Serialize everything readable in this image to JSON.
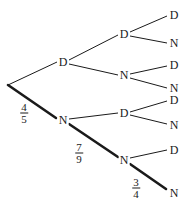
{
  "diagram": {
    "type": "probability-tree",
    "root": {
      "x": 8,
      "y": 85
    },
    "nodes": [
      {
        "id": "L1D",
        "label": "D",
        "x": 63,
        "y": 62
      },
      {
        "id": "L1N",
        "label": "N",
        "x": 63,
        "y": 120
      },
      {
        "id": "L2DD",
        "label": "D",
        "x": 124,
        "y": 34
      },
      {
        "id": "L2DN",
        "label": "N",
        "x": 124,
        "y": 75
      },
      {
        "id": "L2ND",
        "label": "D",
        "x": 124,
        "y": 113
      },
      {
        "id": "L2NN",
        "label": "N",
        "x": 124,
        "y": 160
      },
      {
        "id": "L3DDD",
        "label": "D",
        "x": 174,
        "y": 15
      },
      {
        "id": "L3DDN",
        "label": "N",
        "x": 174,
        "y": 43
      },
      {
        "id": "L3DND",
        "label": "D",
        "x": 174,
        "y": 65
      },
      {
        "id": "L3DNN",
        "label": "N",
        "x": 174,
        "y": 88
      },
      {
        "id": "L3NDD",
        "label": "D",
        "x": 174,
        "y": 100
      },
      {
        "id": "L3NDN",
        "label": "N",
        "x": 174,
        "y": 125
      },
      {
        "id": "L3NND",
        "label": "D",
        "x": 174,
        "y": 150
      },
      {
        "id": "L3NNN",
        "label": "N",
        "x": 174,
        "y": 193
      }
    ],
    "probabilities": [
      {
        "num": "4",
        "den": "5",
        "x": 24,
        "y": 113
      },
      {
        "num": "7",
        "den": "9",
        "x": 79,
        "y": 153
      },
      {
        "num": "3",
        "den": "4",
        "x": 136,
        "y": 188
      }
    ]
  }
}
